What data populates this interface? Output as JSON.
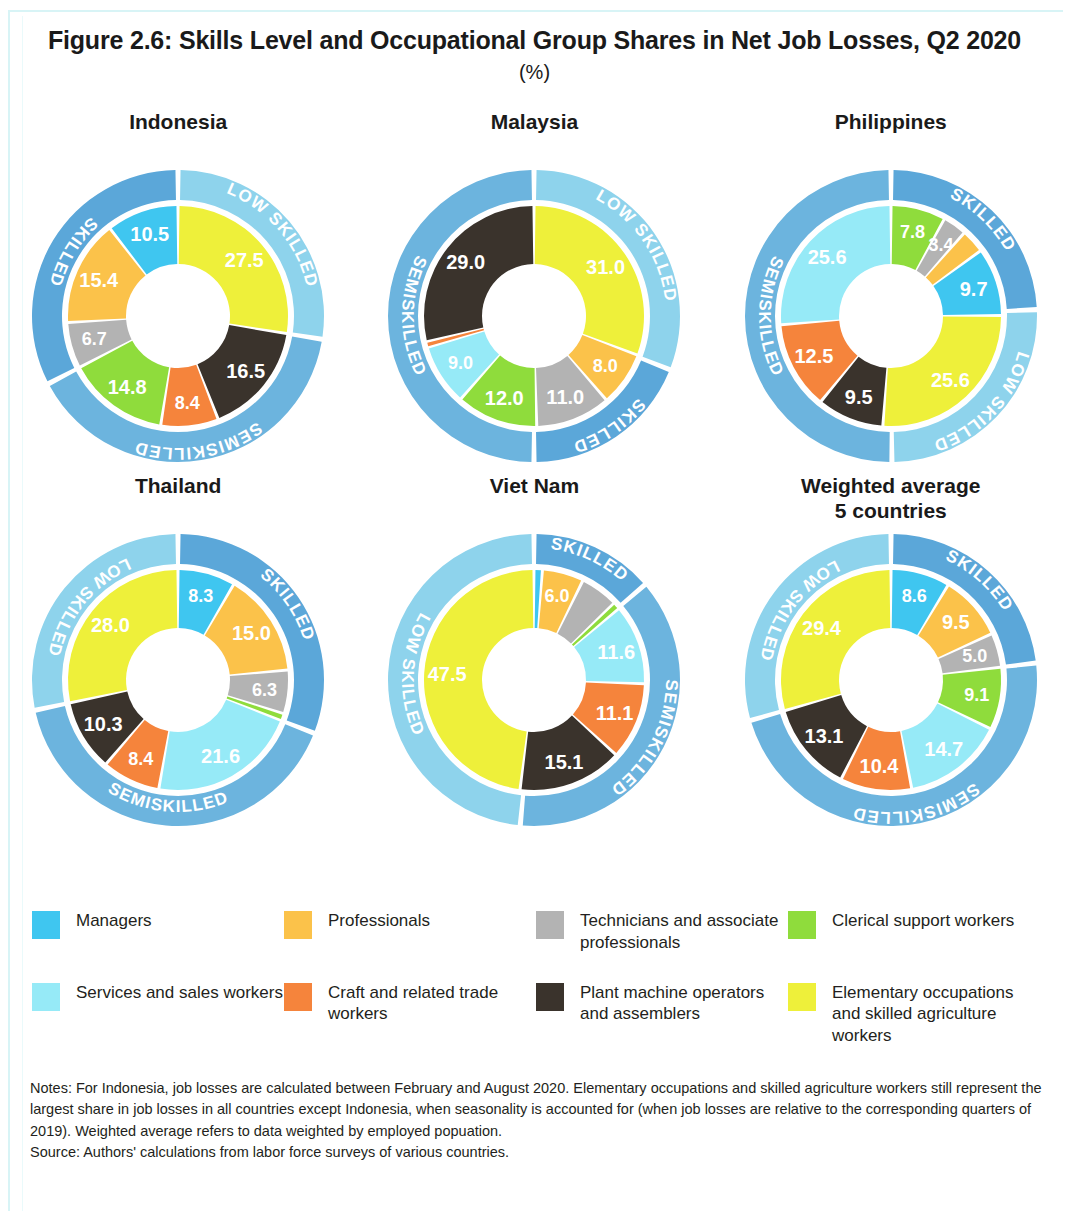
{
  "figure": {
    "title": "Figure 2.6: Skills Level and Occupational Group Shares in Net Job Losses, Q2 2020",
    "subtitle": "(%)"
  },
  "legend": {
    "items": [
      {
        "label": "Managers",
        "color": "#3fc6f0",
        "key": "managers"
      },
      {
        "label": "Professionals",
        "color": "#fbc24a",
        "key": "professionals"
      },
      {
        "label": "Technicians and associate professionals",
        "color": "#b3b3b3",
        "key": "technicians"
      },
      {
        "label": "Clerical support workers",
        "color": "#8fdc3c",
        "key": "clerical"
      },
      {
        "label": "Services and sales workers",
        "color": "#96eaf7",
        "key": "services"
      },
      {
        "label": "Craft and related trade workers",
        "color": "#f5843c",
        "key": "craft"
      },
      {
        "label": "Plant machine operators and assemblers",
        "color": "#3a332c",
        "key": "plant"
      },
      {
        "label": "Elementary occupations and skilled agriculture workers",
        "color": "#eef03a",
        "key": "elementary"
      }
    ]
  },
  "band_colors": {
    "skilled": "#5ba7d9",
    "semiskilled": "#6cb4de",
    "low_skilled": "#8ed3ec"
  },
  "band_labels": {
    "skilled": "SKILLED",
    "semiskilled": "SEMISKILLED",
    "low_skilled": "LOW SKILLED"
  },
  "notes": {
    "line1": "Notes: For Indonesia, job losses are calculated between February and August 2020. Elementary occupations and skilled agriculture workers still represent the largest share in job losses in all countries except Indonesia, when seasonality is accounted for (when job losses are relative to the corresponding quarters of 2019). Weighted average refers to data weighted by employed popuation.",
    "line2": "Source: Authors' calculations from labor force surveys of various countries."
  },
  "chart_data": {
    "type": "pie",
    "title": "Figure 2.6: Skills Level and Occupational Group Shares in Net Job Losses, Q2 2020",
    "subtitle": "(%)",
    "unit": "%",
    "categories": [
      "Managers",
      "Professionals",
      "Technicians and associate professionals",
      "Clerical support workers",
      "Services and sales workers",
      "Craft and related trade workers",
      "Plant machine operators and assemblers",
      "Elementary occupations and skilled agriculture workers"
    ],
    "charts": [
      {
        "name": "Indonesia",
        "title_lines": [
          "Indonesia"
        ],
        "inner": [
          {
            "key": "elementary",
            "value": 27.5,
            "label": "27.5",
            "band": "low_skilled"
          },
          {
            "key": "plant",
            "value": 16.5,
            "label": "16.5",
            "band": "semiskilled"
          },
          {
            "key": "craft",
            "value": 8.4,
            "label": "8.4",
            "band": "semiskilled"
          },
          {
            "key": "clerical",
            "value": 14.8,
            "label": "14.8",
            "band": "semiskilled"
          },
          {
            "key": "technicians",
            "value": 6.7,
            "label": "6.7",
            "band": "skilled"
          },
          {
            "key": "professionals",
            "value": 15.4,
            "label": "15.4",
            "band": "skilled"
          },
          {
            "key": "managers",
            "value": 10.5,
            "label": "10.5",
            "band": "skilled"
          }
        ],
        "bands": [
          {
            "key": "low_skilled",
            "value": 27.5,
            "label": "LOW SKILLED"
          },
          {
            "key": "semiskilled",
            "value": 39.7,
            "label": "SEMISKILLED"
          },
          {
            "key": "skilled",
            "value": 32.6,
            "label": "SKILLED"
          }
        ]
      },
      {
        "name": "Malaysia",
        "title_lines": [
          "Malaysia"
        ],
        "inner": [
          {
            "key": "elementary",
            "value": 31.0,
            "label": "31.0",
            "band": "low_skilled"
          },
          {
            "key": "professionals",
            "value": 8.0,
            "label": "8.0",
            "band": "skilled"
          },
          {
            "key": "technicians",
            "value": 11.0,
            "label": "11.0",
            "band": "skilled"
          },
          {
            "key": "clerical",
            "value": 12.0,
            "label": "12.0",
            "band": "semiskilled"
          },
          {
            "key": "services",
            "value": 9.0,
            "label": "9.0",
            "band": "semiskilled"
          },
          {
            "key": "craft",
            "value": 0.8,
            "label": "",
            "band": "semiskilled"
          },
          {
            "key": "plant",
            "value": 29.0,
            "label": "29.0",
            "band": "semiskilled"
          }
        ],
        "bands": [
          {
            "key": "low_skilled",
            "value": 31.0,
            "label": "LOW SKILLED"
          },
          {
            "key": "skilled",
            "value": 19.0,
            "label": "SKILLED"
          },
          {
            "key": "semiskilled",
            "value": 50.0,
            "label": "SEMISKILLED"
          }
        ]
      },
      {
        "name": "Philippines",
        "title_lines": [
          "Philippines"
        ],
        "inner": [
          {
            "key": "clerical",
            "value": 7.8,
            "label": "7.8",
            "band": "skilled"
          },
          {
            "key": "technicians",
            "value": 3.4,
            "label": "3.4",
            "band": "skilled"
          },
          {
            "key": "professionals",
            "value": 3.4,
            "label": "",
            "band": "skilled"
          },
          {
            "key": "managers",
            "value": 9.7,
            "label": "9.7",
            "band": "skilled"
          },
          {
            "key": "elementary",
            "value": 25.6,
            "label": "25.6",
            "band": "low_skilled"
          },
          {
            "key": "plant",
            "value": 9.5,
            "label": "9.5",
            "band": "semiskilled"
          },
          {
            "key": "craft",
            "value": 12.5,
            "label": "12.5",
            "band": "semiskilled"
          },
          {
            "key": "services",
            "value": 25.6,
            "label": "25.6",
            "band": "semiskilled"
          }
        ],
        "bands": [
          {
            "key": "skilled",
            "value": 24.3,
            "label": "SKILLED"
          },
          {
            "key": "low_skilled",
            "value": 25.6,
            "label": "LOW SKILLED"
          },
          {
            "key": "semiskilled",
            "value": 50.1,
            "label": "SEMISKILLED"
          }
        ]
      },
      {
        "name": "Thailand",
        "title_lines": [
          "Thailand"
        ],
        "inner": [
          {
            "key": "managers",
            "value": 8.3,
            "label": "8.3",
            "band": "skilled"
          },
          {
            "key": "professionals",
            "value": 15.0,
            "label": "15.0",
            "band": "skilled"
          },
          {
            "key": "technicians",
            "value": 6.3,
            "label": "6.3",
            "band": "skilled"
          },
          {
            "key": "clerical",
            "value": 1.0,
            "label": "",
            "band": "skilled"
          },
          {
            "key": "services",
            "value": 21.6,
            "label": "21.6",
            "band": "semiskilled"
          },
          {
            "key": "craft",
            "value": 8.4,
            "label": "8.4",
            "band": "semiskilled"
          },
          {
            "key": "plant",
            "value": 10.3,
            "label": "10.3",
            "band": "semiskilled"
          },
          {
            "key": "elementary",
            "value": 28.0,
            "label": "28.0",
            "band": "low_skilled"
          }
        ],
        "bands": [
          {
            "key": "skilled",
            "value": 30.6,
            "label": "SKILLED"
          },
          {
            "key": "semiskilled",
            "value": 40.3,
            "label": "SEMISKILLED"
          },
          {
            "key": "low_skilled",
            "value": 28.0,
            "label": "LOW SKILLED"
          }
        ]
      },
      {
        "name": "Viet Nam",
        "title_lines": [
          "Viet Nam"
        ],
        "inner": [
          {
            "key": "managers",
            "value": 1.2,
            "label": "",
            "band": "skilled"
          },
          {
            "key": "professionals",
            "value": 6.0,
            "label": "6.0",
            "band": "skilled"
          },
          {
            "key": "technicians",
            "value": 5.5,
            "label": "",
            "band": "skilled"
          },
          {
            "key": "clerical",
            "value": 1.0,
            "label": "",
            "band": "skilled"
          },
          {
            "key": "services",
            "value": 11.6,
            "label": "11.6",
            "band": "semiskilled"
          },
          {
            "key": "craft",
            "value": 11.1,
            "label": "11.1",
            "band": "semiskilled"
          },
          {
            "key": "plant",
            "value": 15.1,
            "label": "15.1",
            "band": "semiskilled"
          },
          {
            "key": "elementary",
            "value": 47.5,
            "label": "47.5",
            "band": "low_skilled"
          }
        ],
        "bands": [
          {
            "key": "skilled",
            "value": 13.7,
            "label": "SKILLED"
          },
          {
            "key": "semiskilled",
            "value": 37.8,
            "label": "SEMISKILLED"
          },
          {
            "key": "low_skilled",
            "value": 48.5,
            "label": "LOW SKILLED"
          }
        ]
      },
      {
        "name": "Weighted average 5 countries",
        "title_lines": [
          "Weighted average",
          "5 countries"
        ],
        "inner": [
          {
            "key": "managers",
            "value": 8.6,
            "label": "8.6",
            "band": "skilled"
          },
          {
            "key": "professionals",
            "value": 9.5,
            "label": "9.5",
            "band": "skilled"
          },
          {
            "key": "technicians",
            "value": 5.0,
            "label": "5.0",
            "band": "skilled"
          },
          {
            "key": "clerical",
            "value": 9.1,
            "label": "9.1",
            "band": "semiskilled"
          },
          {
            "key": "services",
            "value": 14.7,
            "label": "14.7",
            "band": "semiskilled"
          },
          {
            "key": "craft",
            "value": 10.4,
            "label": "10.4",
            "band": "semiskilled"
          },
          {
            "key": "plant",
            "value": 13.1,
            "label": "13.1",
            "band": "semiskilled"
          },
          {
            "key": "elementary",
            "value": 29.4,
            "label": "29.4",
            "band": "low_skilled"
          }
        ],
        "bands": [
          {
            "key": "skilled",
            "value": 23.1,
            "label": "SKILLED"
          },
          {
            "key": "semiskilled",
            "value": 47.3,
            "label": "SEMISKILLED"
          },
          {
            "key": "low_skilled",
            "value": 29.4,
            "label": "LOW SKILLED"
          }
        ]
      }
    ]
  }
}
